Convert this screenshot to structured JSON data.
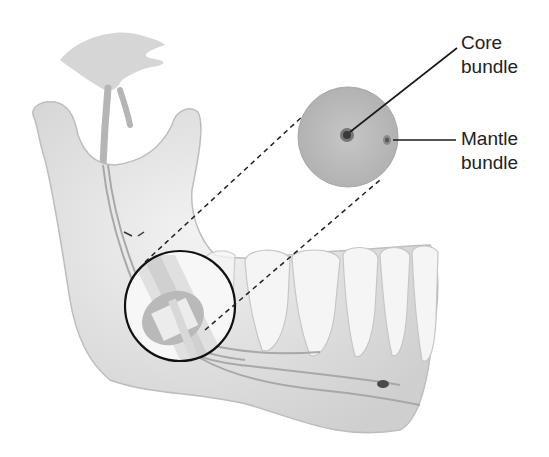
{
  "diagram": {
    "labels": {
      "core": {
        "line1": "Core",
        "line2": "bundle"
      },
      "mantle": {
        "line1": "Mantle",
        "line2": "bundle"
      }
    },
    "colors": {
      "bone": "#e4e4e4",
      "bone_shade": "#c8c8c8",
      "nerve": "#b8b8b8",
      "cross_section": "#bdbdbd",
      "core_bundle": "#555555",
      "leader": "#1a1a1a"
    }
  }
}
